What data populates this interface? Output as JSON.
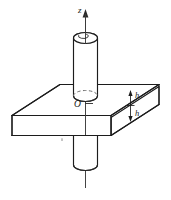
{
  "figure": {
    "kind": "technical-line-drawing",
    "background_color": "#ffffff",
    "line_color": "#1c1c1c",
    "hidden_line_color": "#8e8e8e",
    "labels": {
      "axis_z": "z",
      "origin": "O",
      "thickness_upper": "h",
      "thickness_lower": "h"
    },
    "icons": {
      "axis_arrow": "arrow-up-icon",
      "dimension_arrow_up": "arrow-up-icon",
      "dimension_arrow_down": "arrow-down-icon"
    }
  }
}
